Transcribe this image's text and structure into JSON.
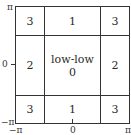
{
  "diagram": {
    "y_axis": {
      "top": "π",
      "middle": "0",
      "bottom": "−π"
    },
    "x_axis": {
      "left": "−π",
      "middle": "0",
      "right": "π"
    },
    "cells": {
      "top_left": "3",
      "top_middle": "1",
      "top_right": "3",
      "middle_left": "2",
      "center_title": "low-low",
      "center_value": "0",
      "middle_right": "2",
      "bottom_left": "3",
      "bottom_middle": "1",
      "bottom_right": "3"
    },
    "line_color": "#333333"
  }
}
